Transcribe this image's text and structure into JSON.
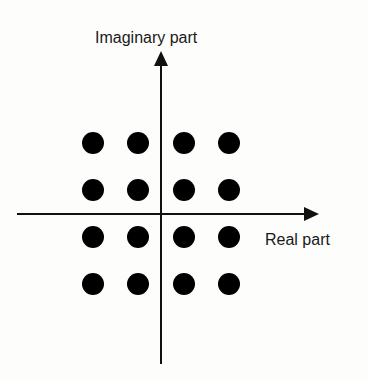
{
  "diagram": {
    "type": "constellation",
    "y_axis_label": "Imaginary part",
    "x_axis_label": "Real part",
    "colors": {
      "axis": "#111111",
      "dot": "#000000",
      "text": "#1a1a1a",
      "background": "#fdfdfc"
    },
    "grid": {
      "rows": 4,
      "cols": 4
    },
    "points": [
      {
        "i": -3,
        "q": 3
      },
      {
        "i": -1,
        "q": 3
      },
      {
        "i": 1,
        "q": 3
      },
      {
        "i": 3,
        "q": 3
      },
      {
        "i": -3,
        "q": 1
      },
      {
        "i": -1,
        "q": 1
      },
      {
        "i": 1,
        "q": 1
      },
      {
        "i": 3,
        "q": 1
      },
      {
        "i": -3,
        "q": -1
      },
      {
        "i": -1,
        "q": -1
      },
      {
        "i": 1,
        "q": -1
      },
      {
        "i": 3,
        "q": -1
      },
      {
        "i": -3,
        "q": -3
      },
      {
        "i": -1,
        "q": -3
      },
      {
        "i": 1,
        "q": -3
      },
      {
        "i": 3,
        "q": -3
      }
    ]
  }
}
